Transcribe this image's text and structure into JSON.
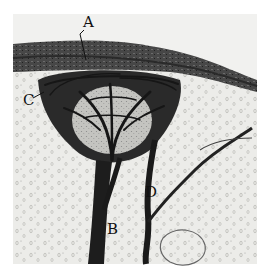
{
  "figure": {
    "labels": [
      {
        "id": "A",
        "text": "A",
        "x": 83,
        "y": 15
      },
      {
        "id": "B",
        "text": "B",
        "x": 107,
        "y": 222
      },
      {
        "id": "C",
        "text": "C",
        "x": 23,
        "y": 93
      },
      {
        "id": "D",
        "text": "D",
        "x": 145,
        "y": 185
      }
    ],
    "colors": {
      "background": "#ffffff",
      "tissue": "#e9e9e6",
      "band": "#3a3a3a",
      "ink": "#141414",
      "cell": "#b8b8b4"
    }
  }
}
